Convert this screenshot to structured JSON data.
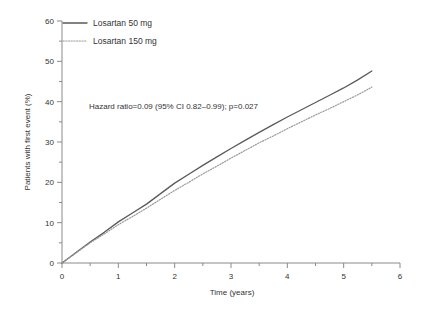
{
  "chart_data": {
    "type": "line",
    "title": "",
    "xlabel": "Time (years)",
    "ylabel": "Patients with first event (%)",
    "xlim": [
      0,
      6
    ],
    "ylim": [
      0,
      60
    ],
    "xticks": [
      0,
      1,
      2,
      3,
      4,
      5,
      6
    ],
    "xtick_labels": [
      "0",
      "1",
      "2",
      "3",
      "4",
      "5",
      "6"
    ],
    "xminor_step": 0.5,
    "yticks": [
      0,
      10,
      20,
      30,
      40,
      50,
      60
    ],
    "ytick_labels": [
      "0",
      "10",
      "20",
      "30",
      "40",
      "50",
      "60"
    ],
    "yminor_step": 5,
    "grid": false,
    "legend_position": "top-left",
    "annotation": "Hazard ratio=0.09 (95% CI 0.82–0.99); p=0.027",
    "x": [
      0,
      0.25,
      0.5,
      0.75,
      1.0,
      1.25,
      1.5,
      1.75,
      2.0,
      2.25,
      2.5,
      2.75,
      3.0,
      3.25,
      3.5,
      3.75,
      4.0,
      4.25,
      4.5,
      4.75,
      5.0,
      5.25,
      5.5
    ],
    "series": [
      {
        "name": "Losartan 50 mg",
        "style": "solid",
        "color": "#5a5a5a",
        "values": [
          0,
          2.6,
          5.2,
          7.6,
          10.2,
          12.4,
          14.6,
          17.2,
          19.8,
          22.0,
          24.2,
          26.3,
          28.4,
          30.4,
          32.4,
          34.3,
          36.2,
          38.0,
          39.8,
          41.6,
          43.4,
          45.4,
          47.6
        ]
      },
      {
        "name": "Losartan 150 mg",
        "style": "dotted",
        "color": "#9a9a9a",
        "values": [
          0,
          2.5,
          5.0,
          7.2,
          9.5,
          11.5,
          13.6,
          15.8,
          18.0,
          20.0,
          22.1,
          24.0,
          26.0,
          27.9,
          29.8,
          31.5,
          33.3,
          35.0,
          36.7,
          38.3,
          40.0,
          41.7,
          43.6
        ]
      }
    ]
  },
  "legend": {
    "entries": [
      {
        "label": "Losartan 50 mg",
        "style": "solid"
      },
      {
        "label": "Losartan 150 mg",
        "style": "dotted"
      }
    ]
  }
}
